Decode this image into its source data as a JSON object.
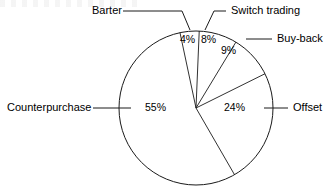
{
  "chart_data": {
    "type": "pie",
    "title": "",
    "subtitle": "",
    "xlabel": "",
    "ylabel": "",
    "legend_position": "callout-labels",
    "grid": false,
    "units": "percent",
    "total": 100,
    "categories": [
      "Barter",
      "Switch trading",
      "Buy-back",
      "Offset",
      "Counterpurchase"
    ],
    "values": [
      4,
      8,
      9,
      24,
      55
    ],
    "slices": [
      {
        "label": "Barter",
        "value": 4,
        "value_label": "4%",
        "start_angle_deg": -12,
        "end_angle_deg": 2.4
      },
      {
        "label": "Switch trading",
        "value": 8,
        "value_label": "8%",
        "start_angle_deg": 2.4,
        "end_angle_deg": 31.2
      },
      {
        "label": "Buy-back",
        "value": 9,
        "value_label": "9%",
        "start_angle_deg": 31.2,
        "end_angle_deg": 63.6
      },
      {
        "label": "Offset",
        "value": 24,
        "value_label": "24%",
        "start_angle_deg": 63.6,
        "end_angle_deg": 150.0
      },
      {
        "label": "Counterpurchase",
        "value": 55,
        "value_label": "55%",
        "start_angle_deg": 150.0,
        "end_angle_deg": 348.0
      }
    ],
    "colors": {
      "stroke": "#1a1a1a",
      "fill": "#ffffff",
      "background": "#ffffff",
      "text": "#000000"
    },
    "geometry": {
      "center_x": 196,
      "center_y": 108,
      "radius": 77
    }
  },
  "callouts": {
    "barter": {
      "label": "Barter",
      "x": 92,
      "y": 7
    },
    "switch_trading": {
      "label": "Switch trading",
      "x": 231,
      "y": 7
    },
    "buy_back": {
      "label": "Buy-back",
      "x": 277,
      "y": 34
    },
    "offset": {
      "label": "Offset",
      "x": 293,
      "y": 102
    },
    "counterpurchase": {
      "label": "Counterpurchase",
      "x": 7,
      "y": 102
    }
  },
  "percent_labels": {
    "barter": {
      "text": "4%",
      "x": 180,
      "y": 35
    },
    "switch_trading": {
      "text": "8%",
      "x": 201,
      "y": 35
    },
    "buy_back": {
      "text": "9%",
      "x": 221,
      "y": 45
    },
    "offset": {
      "text": "24%",
      "x": 224,
      "y": 102
    },
    "counterpurchase": {
      "text": "55%",
      "x": 145,
      "y": 102
    }
  }
}
